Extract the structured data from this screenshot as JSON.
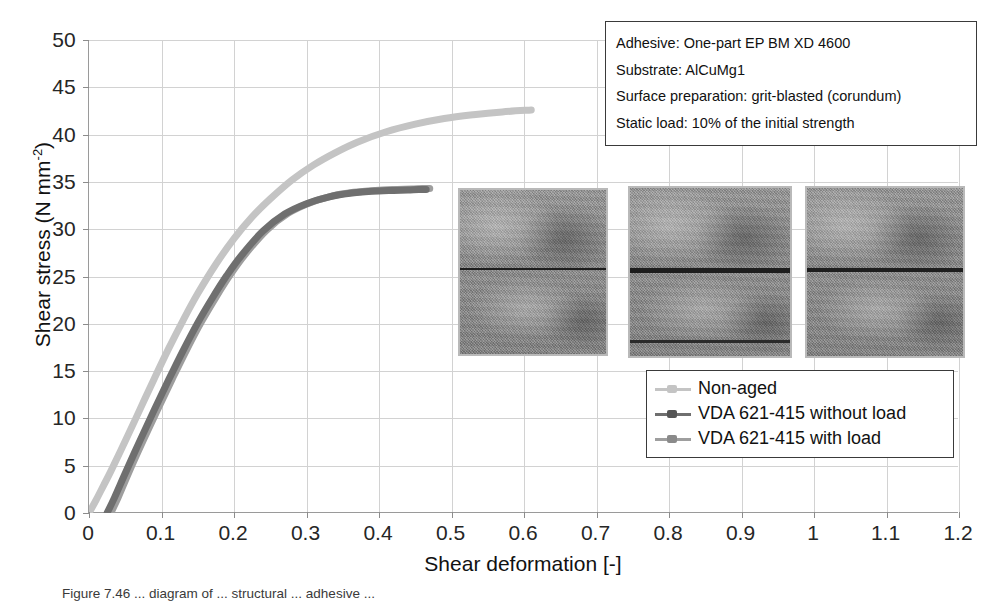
{
  "chart_data": {
    "type": "line",
    "title": "",
    "xlabel": "Shear deformation [-]",
    "ylabel": "Shear stress (N mm-2)",
    "ylabel_base": "Shear stress (N mm",
    "ylabel_sup": "-2",
    "ylabel_tail": ")",
    "xlim": [
      0,
      1.2
    ],
    "ylim": [
      0,
      50
    ],
    "grid": true,
    "legend_position": "inside lower-right",
    "xticks": [
      "0",
      "0.1",
      "0.2",
      "0.3",
      "0.4",
      "0.5",
      "0.6",
      "0.7",
      "0.8",
      "0.9",
      "1",
      "1.1",
      "1.2"
    ],
    "xtick_values": [
      0,
      0.1,
      0.2,
      0.3,
      0.4,
      0.5,
      0.6,
      0.7,
      0.8,
      0.9,
      1,
      1.1,
      1.2
    ],
    "yticks": [
      "0",
      "5",
      "10",
      "15",
      "20",
      "25",
      "30",
      "35",
      "40",
      "45",
      "50"
    ],
    "ytick_values": [
      0,
      5,
      10,
      15,
      20,
      25,
      30,
      35,
      40,
      45,
      50
    ],
    "series": [
      {
        "name": "Non-aged",
        "color": "#c4c4c4",
        "x": [
          0.0,
          0.01,
          0.02,
          0.03,
          0.05,
          0.07,
          0.09,
          0.11,
          0.13,
          0.15,
          0.175,
          0.2,
          0.225,
          0.25,
          0.28,
          0.31,
          0.34,
          0.37,
          0.41,
          0.45,
          0.49,
          0.53,
          0.57,
          0.61
        ],
        "y": [
          0.0,
          1.4,
          2.9,
          4.4,
          7.6,
          10.9,
          14.2,
          17.4,
          20.4,
          23.2,
          26.3,
          29.0,
          31.3,
          33.2,
          35.2,
          36.8,
          38.1,
          39.2,
          40.3,
          41.1,
          41.7,
          42.1,
          42.4,
          42.6
        ]
      },
      {
        "name": "VDA 621-415 without load",
        "color": "#6f6f6f",
        "x": [
          0.025,
          0.035,
          0.05,
          0.07,
          0.09,
          0.11,
          0.13,
          0.15,
          0.17,
          0.19,
          0.21,
          0.24,
          0.27,
          0.3,
          0.33,
          0.36,
          0.39,
          0.42,
          0.44,
          0.455,
          0.465
        ],
        "y": [
          0.0,
          1.6,
          4.2,
          7.6,
          10.9,
          14.1,
          17.2,
          20.1,
          22.7,
          25.1,
          27.2,
          29.8,
          31.6,
          32.7,
          33.4,
          33.8,
          34.0,
          34.1,
          34.15,
          34.2,
          34.2
        ]
      },
      {
        "name": "VDA 621-415 with load",
        "color": "#9e9e9e",
        "x": [
          0.03,
          0.04,
          0.055,
          0.075,
          0.095,
          0.115,
          0.135,
          0.155,
          0.175,
          0.195,
          0.215,
          0.245,
          0.275,
          0.305,
          0.335,
          0.365,
          0.395,
          0.425,
          0.445,
          0.46,
          0.47
        ],
        "y": [
          0.0,
          1.6,
          4.3,
          7.7,
          11.0,
          14.2,
          17.3,
          20.2,
          22.8,
          25.2,
          27.3,
          29.9,
          31.7,
          32.8,
          33.5,
          33.9,
          34.1,
          34.2,
          34.25,
          34.3,
          34.3
        ]
      }
    ]
  },
  "info_box": {
    "lines": [
      "Adhesive: One-part EP BM XD 4600",
      "Substrate: AlCuMg1",
      "Surface preparation: grit-blasted (corundum)",
      "Static load: 10% of the initial strength"
    ]
  },
  "legend": {
    "items": [
      {
        "label": "Non-aged",
        "color": "#c4c4c4"
      },
      {
        "label": "VDA 621-415 without load",
        "color": "#6f6f6f"
      },
      {
        "label": "VDA 621-415 with load",
        "color": "#9e9e9e"
      }
    ]
  },
  "photos": [
    {
      "name": "fracture-surface-non-aged"
    },
    {
      "name": "fracture-surface-without-load"
    },
    {
      "name": "fracture-surface-with-load"
    }
  ],
  "caption": {
    "text": "Figure 7.46   ... diagram of ... structural ... adhesive ..."
  }
}
